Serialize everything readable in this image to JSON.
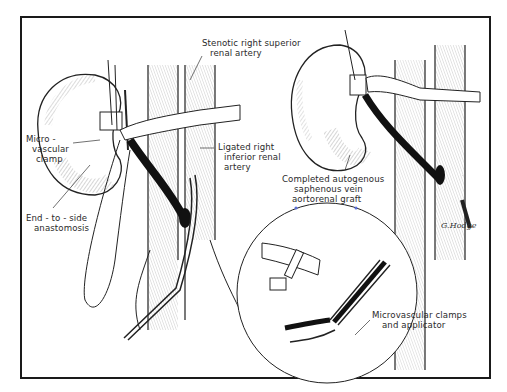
{
  "figure": {
    "type": "surgical-illustration",
    "labels": {
      "stenotic": [
        "Stenotic right superior",
        "renal artery"
      ],
      "micro_clamp": [
        "Micro -",
        "vascular",
        "clamp"
      ],
      "ligated": [
        "Ligated right",
        "inferior renal",
        "artery"
      ],
      "end_to_side": [
        "End - to - side",
        "anastomosis"
      ],
      "completed_graft": [
        "Completed autogenous",
        "saphenous vein",
        "aortorenal graft"
      ],
      "clamps_applicator": [
        "Microvascular clamps",
        "and applicator"
      ]
    },
    "signature": "G.Hodge"
  }
}
